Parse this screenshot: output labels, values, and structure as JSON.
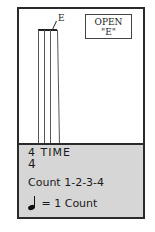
{
  "diagram": {
    "title_box": {
      "line1": "OPEN",
      "line2": "\"E\""
    },
    "string_label": "E",
    "strings_count": 4,
    "time_signature": {
      "top": "4",
      "label": "TIME",
      "bottom": "4"
    },
    "count_text": "Count 1-2-3-4",
    "note_rule": {
      "symbol": "quarter-note",
      "text": "= 1 Count"
    },
    "colors": {
      "frame": "#2a2a2a",
      "panel": "#d6d6d6",
      "background": "#ffffff"
    }
  }
}
